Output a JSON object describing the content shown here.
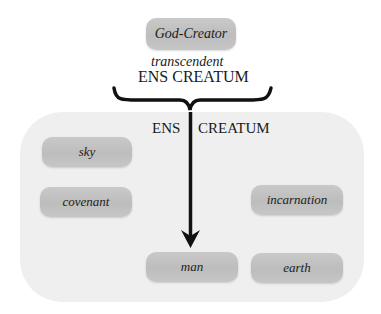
{
  "diagram": {
    "top_node": {
      "label": "God-Creator"
    },
    "transcendent_label": "transcendent",
    "upper_ens_creatum": "ENS CREATUM",
    "lower_ens": "ENS",
    "lower_creatum": "CREATUM",
    "nodes": [
      {
        "id": "sky",
        "label": "sky"
      },
      {
        "id": "covenant",
        "label": "covenant"
      },
      {
        "id": "incarnation",
        "label": "incarnation"
      },
      {
        "id": "man",
        "label": "man"
      },
      {
        "id": "earth",
        "label": "earth"
      }
    ],
    "colors": {
      "node_fill": "#c4c4c4",
      "panel_fill": "#efefef",
      "ink": "#1a1a1a",
      "background": "#ffffff"
    }
  }
}
